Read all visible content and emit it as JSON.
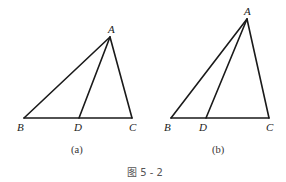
{
  "figure": {
    "caption": "图 5 - 2",
    "panels": [
      {
        "id": "a",
        "label": "(a)",
        "points": {
          "A": "A",
          "B": "B",
          "C": "C",
          "D": "D"
        },
        "segments": [
          "AB",
          "AC",
          "BC",
          "AD"
        ]
      },
      {
        "id": "b",
        "label": "(b)",
        "points": {
          "A": "A",
          "B": "B",
          "C": "C",
          "D": "D"
        },
        "segments": [
          "AB",
          "AC",
          "BC",
          "AD"
        ]
      }
    ]
  }
}
